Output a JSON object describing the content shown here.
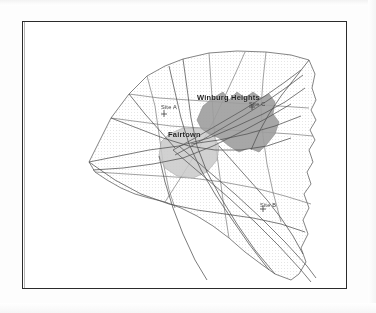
{
  "document": {
    "kind": "scanned-map-figure",
    "frame": {
      "visible": true,
      "border_color": "#2b2b2b"
    },
    "background_color": "#ffffff"
  },
  "map": {
    "title": "",
    "region_outline_color": "#6b6b6b",
    "grid_texture": "dotted",
    "grid_color": "#b9b9b9",
    "road_color": "#5f5f5f",
    "urban_areas": [
      {
        "name": "Winburg Heights",
        "fill": "#9a9a9a",
        "label_x": 196,
        "label_y": 92
      },
      {
        "name": "Fairtown",
        "fill": "#c6c6c6",
        "label_x": 167,
        "label_y": 129
      }
    ],
    "sites": [
      {
        "label": "Site A",
        "label_x": 160,
        "label_y": 103
      },
      {
        "label": "Site C",
        "label_x": 248,
        "label_y": 100
      },
      {
        "label": "Site B",
        "label_x": 259,
        "label_y": 201
      }
    ]
  }
}
